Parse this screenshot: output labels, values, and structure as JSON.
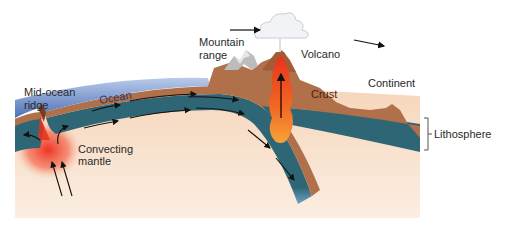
{
  "diagram": {
    "type": "cross-section",
    "labels": {
      "mid_ocean_ridge_line1": "Mid-ocean",
      "mid_ocean_ridge_line2": "ridge",
      "ocean": "Ocean",
      "convecting_mantle_line1": "Convecting",
      "convecting_mantle_line2": "mantle",
      "mountain_range_line1": "Mountain",
      "mountain_range_line2": "range",
      "volcano": "Volcano",
      "crust": "Crust",
      "continent": "Continent",
      "lithosphere": "Lithosphere"
    },
    "colors": {
      "ocean_water": "#5b7fc4",
      "ocean_water_light": "#a9bde3",
      "crust": "#b0704a",
      "lithosphere_mantle": "#2f6676",
      "mantle": "#f5d9c0",
      "magma": "#e8401c",
      "magma_light": "#f59a2c",
      "mountain_snow": "#c9c9c9",
      "cloud": "#eef1f6"
    },
    "arrows": [
      {
        "name": "plate-motion-arrow-left",
        "direction": "right"
      },
      {
        "name": "plate-motion-arrow-right",
        "direction": "right-down"
      },
      {
        "name": "magma-rise-arrow",
        "direction": "up"
      },
      {
        "name": "mantle-upwelling-arrows",
        "direction": "up"
      },
      {
        "name": "ocean-plate-flow-arrows",
        "direction": "toward-subduction"
      }
    ]
  }
}
